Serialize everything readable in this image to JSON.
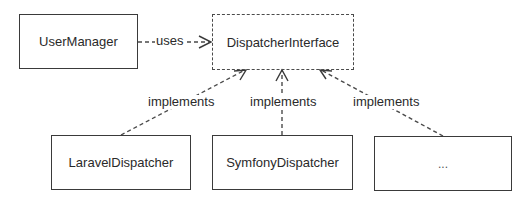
{
  "diagram": {
    "type": "uml-class-dependency",
    "nodes": [
      {
        "id": "user_manager",
        "label": "UserManager",
        "style": "solid"
      },
      {
        "id": "dispatcher_interface",
        "label": "DispatcherInterface",
        "style": "dashed"
      },
      {
        "id": "laravel_dispatcher",
        "label": "LaravelDispatcher",
        "style": "solid"
      },
      {
        "id": "symfony_dispatcher",
        "label": "SymfonyDispatcher",
        "style": "solid"
      },
      {
        "id": "other_dispatcher",
        "label": "...",
        "style": "solid"
      }
    ],
    "edges": [
      {
        "from": "user_manager",
        "to": "dispatcher_interface",
        "label": "uses",
        "style": "dashed-open-arrow"
      },
      {
        "from": "laravel_dispatcher",
        "to": "dispatcher_interface",
        "label": "implements",
        "style": "dashed-open-arrow"
      },
      {
        "from": "symfony_dispatcher",
        "to": "dispatcher_interface",
        "label": "implements",
        "style": "dashed-open-arrow"
      },
      {
        "from": "other_dispatcher",
        "to": "dispatcher_interface",
        "label": "implements",
        "style": "dashed-open-arrow"
      }
    ]
  },
  "labels": {
    "user_manager": "UserManager",
    "dispatcher_interface": "DispatcherInterface",
    "laravel_dispatcher": "LaravelDispatcher",
    "symfony_dispatcher": "SymfonyDispatcher",
    "other_dispatcher": "...",
    "uses": "uses",
    "implements_left": "implements",
    "implements_middle": "implements",
    "implements_right": "implements"
  }
}
